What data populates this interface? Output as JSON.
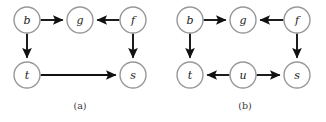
{
  "figure": {
    "background_color": "#ffffff",
    "node_stroke_color": "#999999",
    "node_fill_color": "#ffffff",
    "edge_color": "#111111",
    "label_color": "#1a1a1a",
    "caption_color": "#3a3a3a",
    "node_radius": 13
  },
  "panels": [
    {
      "id": "panel-a",
      "caption": "(a)",
      "caption_pos": {
        "x": 80,
        "y": 105
      },
      "nodes": [
        {
          "id": "a-b",
          "label": "b",
          "x": 27,
          "y": 20
        },
        {
          "id": "a-g",
          "label": "g",
          "x": 80,
          "y": 20
        },
        {
          "id": "a-f",
          "label": "f",
          "x": 133,
          "y": 20
        },
        {
          "id": "a-t",
          "label": "t",
          "x": 27,
          "y": 75
        },
        {
          "id": "a-s",
          "label": "s",
          "x": 133,
          "y": 75
        }
      ],
      "edges": [
        {
          "id": "a-edge-b-g",
          "from": "b",
          "to": "g",
          "directed": true
        },
        {
          "id": "a-edge-f-g",
          "from": "f",
          "to": "g",
          "directed": true
        },
        {
          "id": "a-edge-b-t",
          "from": "b",
          "to": "t",
          "directed": true
        },
        {
          "id": "a-edge-f-s",
          "from": "f",
          "to": "s",
          "directed": true
        },
        {
          "id": "a-edge-t-s",
          "from": "t",
          "to": "s",
          "directed": true
        }
      ]
    },
    {
      "id": "panel-b",
      "caption": "(b)",
      "caption_pos": {
        "x": 245,
        "y": 105
      },
      "nodes": [
        {
          "id": "b-b",
          "label": "b",
          "x": 190,
          "y": 20
        },
        {
          "id": "b-g",
          "label": "g",
          "x": 243,
          "y": 20
        },
        {
          "id": "b-f",
          "label": "f",
          "x": 297,
          "y": 20
        },
        {
          "id": "b-t",
          "label": "t",
          "x": 190,
          "y": 75
        },
        {
          "id": "b-u",
          "label": "u",
          "x": 243,
          "y": 75
        },
        {
          "id": "b-s",
          "label": "s",
          "x": 297,
          "y": 75
        }
      ],
      "edges": [
        {
          "id": "b-edge-b-g",
          "from": "b",
          "to": "g",
          "directed": true
        },
        {
          "id": "b-edge-f-g",
          "from": "f",
          "to": "g",
          "directed": true
        },
        {
          "id": "b-edge-b-t",
          "from": "b",
          "to": "t",
          "directed": true
        },
        {
          "id": "b-edge-f-s",
          "from": "f",
          "to": "s",
          "directed": true
        },
        {
          "id": "b-edge-u-t",
          "from": "u",
          "to": "t",
          "directed": true
        },
        {
          "id": "b-edge-u-s",
          "from": "u",
          "to": "s",
          "directed": true
        }
      ]
    }
  ]
}
